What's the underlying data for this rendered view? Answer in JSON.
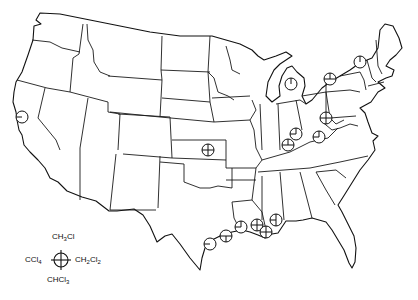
{
  "figure": {
    "type": "map",
    "region": "Contiguous United States",
    "symbol_legend": {
      "top": "CH3Cl",
      "left": "CCl4",
      "right": "CH2Cl2",
      "bottom": "CHCl3",
      "top_html": [
        "CH",
        "3",
        "Cl"
      ],
      "left_html": [
        "CCl",
        "4"
      ],
      "right_html": [
        "CH",
        "2",
        "Cl",
        "2"
      ],
      "bottom_html": [
        "CHCl",
        "3"
      ]
    },
    "sites": [
      {
        "id": "california",
        "x": 22,
        "y": 117,
        "r": 6,
        "quadrants": [
          "CCl4"
        ]
      },
      {
        "id": "kansas",
        "x": 208,
        "y": 150,
        "r": 6,
        "quadrants": [
          "CH3Cl",
          "CCl4",
          "CH2Cl2",
          "CHCl3"
        ]
      },
      {
        "id": "michigan",
        "x": 291,
        "y": 84,
        "r": 6,
        "quadrants": [
          "CH3Cl"
        ]
      },
      {
        "id": "ohio-northeast",
        "x": 330,
        "y": 79,
        "r": 6,
        "quadrants": [
          "CCl4",
          "CH2Cl2",
          "CH3Cl"
        ]
      },
      {
        "id": "new-york",
        "x": 360,
        "y": 62,
        "r": 6,
        "quadrants": [
          "CH3Cl"
        ]
      },
      {
        "id": "west-virginia",
        "x": 326,
        "y": 118,
        "r": 6,
        "quadrants": [
          "CH3Cl",
          "CCl4",
          "CH2Cl2",
          "CHCl3"
        ]
      },
      {
        "id": "indiana-south",
        "x": 296,
        "y": 134,
        "r": 6,
        "quadrants": [
          "CH3Cl",
          "CCl4"
        ]
      },
      {
        "id": "kentucky",
        "x": 319,
        "y": 137,
        "r": 6,
        "quadrants": [
          "CH3Cl",
          "CCl4"
        ]
      },
      {
        "id": "indiana-southwest",
        "x": 288,
        "y": 145,
        "r": 6,
        "quadrants": [
          "CH3Cl",
          "CCl4",
          "CH2Cl2"
        ]
      },
      {
        "id": "texas-coast",
        "x": 210,
        "y": 244,
        "r": 6,
        "quadrants": [
          "CCl4"
        ]
      },
      {
        "id": "texas-houston",
        "x": 226,
        "y": 236,
        "r": 6,
        "quadrants": [
          "CCl4",
          "CH2Cl2",
          "CHCl3"
        ]
      },
      {
        "id": "louisiana-west",
        "x": 241,
        "y": 227,
        "r": 6,
        "quadrants": [
          "CH3Cl",
          "CCl4"
        ]
      },
      {
        "id": "louisiana-baton-rouge",
        "x": 257,
        "y": 225,
        "r": 6,
        "quadrants": [
          "CH3Cl",
          "CCl4",
          "CH2Cl2",
          "CHCl3"
        ]
      },
      {
        "id": "louisiana-new-orleans",
        "x": 266,
        "y": 232,
        "r": 6,
        "quadrants": [
          "CH3Cl",
          "CCl4",
          "CH2Cl2",
          "CHCl3"
        ]
      },
      {
        "id": "mississippi-coast",
        "x": 276,
        "y": 220,
        "r": 6,
        "quadrants": [
          "CH3Cl",
          "CCl4",
          "CHCl3"
        ]
      }
    ]
  }
}
